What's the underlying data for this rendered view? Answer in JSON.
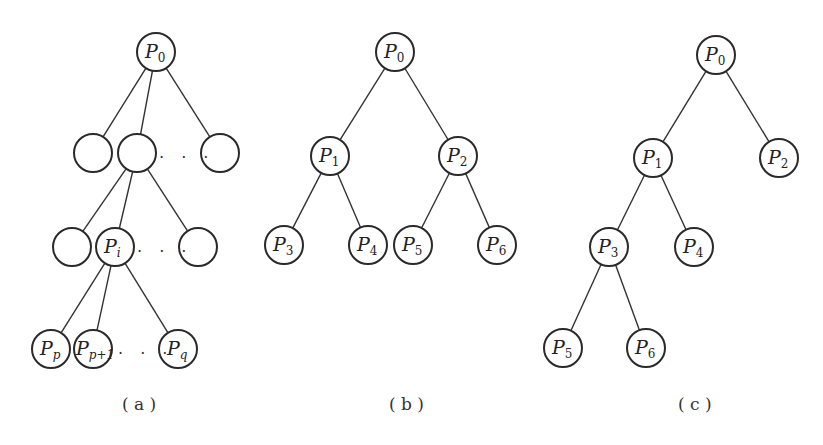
{
  "figures": [
    {
      "id": "a",
      "caption": "( a )",
      "nodes": [
        {
          "id": "a0",
          "x": 156,
          "y": 52,
          "base": "P",
          "sub": "0",
          "subItalic": false
        },
        {
          "id": "a1",
          "x": 93,
          "y": 153,
          "base": "",
          "sub": ""
        },
        {
          "id": "a2",
          "x": 137,
          "y": 153,
          "base": "",
          "sub": ""
        },
        {
          "id": "a3",
          "x": 220,
          "y": 153,
          "base": "",
          "sub": ""
        },
        {
          "id": "a4",
          "x": 72,
          "y": 247,
          "base": "",
          "sub": ""
        },
        {
          "id": "a5",
          "x": 115,
          "y": 247,
          "base": "P",
          "sub": "i",
          "subItalic": true
        },
        {
          "id": "a6",
          "x": 198,
          "y": 247,
          "base": "",
          "sub": ""
        },
        {
          "id": "a7",
          "x": 51,
          "y": 349,
          "base": "P",
          "sub": "p",
          "subItalic": true
        },
        {
          "id": "a8",
          "x": 93,
          "y": 349,
          "base": "P",
          "sub": "p+1",
          "subItalic": true
        },
        {
          "id": "a9",
          "x": 178,
          "y": 349,
          "base": "P",
          "sub": "q",
          "subItalic": true
        }
      ],
      "edges": [
        [
          "a0",
          "a1"
        ],
        [
          "a0",
          "a2"
        ],
        [
          "a0",
          "a3"
        ],
        [
          "a2",
          "a4"
        ],
        [
          "a2",
          "a5"
        ],
        [
          "a2",
          "a6"
        ],
        [
          "a5",
          "a7"
        ],
        [
          "a5",
          "a8"
        ],
        [
          "a5",
          "a9"
        ]
      ],
      "ellipses": [
        {
          "x": 159,
          "y": 158,
          "text": ". . ."
        },
        {
          "x": 137,
          "y": 252,
          "text": ". . ."
        },
        {
          "x": 118,
          "y": 354,
          "text": ". . ."
        }
      ],
      "caption_pos": {
        "x": 122,
        "y": 410
      }
    },
    {
      "id": "b",
      "caption": "( b )",
      "nodes": [
        {
          "id": "b0",
          "x": 395,
          "y": 52,
          "base": "P",
          "sub": "0"
        },
        {
          "id": "b1",
          "x": 330,
          "y": 156,
          "base": "P",
          "sub": "1"
        },
        {
          "id": "b2",
          "x": 458,
          "y": 156,
          "base": "P",
          "sub": "2"
        },
        {
          "id": "b3",
          "x": 284,
          "y": 245,
          "base": "P",
          "sub": "3"
        },
        {
          "id": "b4",
          "x": 368,
          "y": 245,
          "base": "P",
          "sub": "4"
        },
        {
          "id": "b5",
          "x": 413,
          "y": 245,
          "base": "P",
          "sub": "5"
        },
        {
          "id": "b6",
          "x": 497,
          "y": 245,
          "base": "P",
          "sub": "6"
        }
      ],
      "edges": [
        [
          "b0",
          "b1"
        ],
        [
          "b0",
          "b2"
        ],
        [
          "b1",
          "b3"
        ],
        [
          "b1",
          "b4"
        ],
        [
          "b2",
          "b5"
        ],
        [
          "b2",
          "b6"
        ]
      ],
      "ellipses": [],
      "caption_pos": {
        "x": 389,
        "y": 410
      }
    },
    {
      "id": "c",
      "caption": "( c )",
      "nodes": [
        {
          "id": "c0",
          "x": 716,
          "y": 55,
          "base": "P",
          "sub": "0"
        },
        {
          "id": "c1",
          "x": 653,
          "y": 158,
          "base": "P",
          "sub": "1"
        },
        {
          "id": "c2",
          "x": 779,
          "y": 158,
          "base": "P",
          "sub": "2"
        },
        {
          "id": "c3",
          "x": 609,
          "y": 247,
          "base": "P",
          "sub": "3"
        },
        {
          "id": "c4",
          "x": 694,
          "y": 247,
          "base": "P",
          "sub": "4"
        },
        {
          "id": "c5",
          "x": 563,
          "y": 348,
          "base": "P",
          "sub": "5"
        },
        {
          "id": "c6",
          "x": 646,
          "y": 348,
          "base": "P",
          "sub": "6"
        }
      ],
      "edges": [
        [
          "c0",
          "c1"
        ],
        [
          "c0",
          "c2"
        ],
        [
          "c1",
          "c3"
        ],
        [
          "c1",
          "c4"
        ],
        [
          "c3",
          "c5"
        ],
        [
          "c3",
          "c6"
        ]
      ],
      "ellipses": [],
      "caption_pos": {
        "x": 678,
        "y": 410
      }
    }
  ],
  "style": {
    "node_radius": 19,
    "stroke": "#2a2a2a",
    "background": "#ffffff"
  }
}
